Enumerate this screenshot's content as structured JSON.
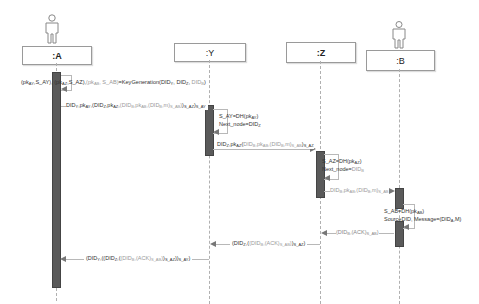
{
  "participants": [
    {
      "id": "A",
      "label": ":A",
      "actor": true
    },
    {
      "id": "Y",
      "label": ":Y",
      "actor": false
    },
    {
      "id": "Z",
      "label": ":Z",
      "actor": false
    },
    {
      "id": "B",
      "label": ":B",
      "actor": true
    }
  ],
  "messages": [
    {
      "from": "A",
      "to": "A",
      "type": "self",
      "label": "(pk_AY, S_AY), (pk_AZ, S_AZ), (pk_AB, S_AB)=KeyGeneration(DID_Y, DID_Z, DID_B)"
    },
    {
      "from": "A",
      "to": "Y",
      "type": "sync",
      "label": "DID_Y, pk_AY, (DID_Z, pk_AZ, (DID_B, pk_AB, (DID_B, m)_S_AB)_S_AZ)_S_AY"
    },
    {
      "from": "Y",
      "to": "Y",
      "type": "self",
      "label": "S_AY=DH(pk_AY); Next_node=DID_Z"
    },
    {
      "from": "Y",
      "to": "Z",
      "type": "sync",
      "label": "DID_Z, pk_AZ, (DID_B, pk_AB, (DID_B, m)_S_AB)_S_AZ"
    },
    {
      "from": "Z",
      "to": "Z",
      "type": "self",
      "label": "S_AZ=DH(pk_AZ); Next_node=DID_B"
    },
    {
      "from": "Z",
      "to": "B",
      "type": "sync",
      "label": "DID_B, pk_AB, (DID_B, m)_S_AB"
    },
    {
      "from": "B",
      "to": "B",
      "type": "self",
      "label": "S_AB=DH(pk_AB); SourceDID, Message=(DID_A, M)"
    },
    {
      "from": "B",
      "to": "Z",
      "type": "return",
      "label": "(DID_B, (ACK)_S_AB)"
    },
    {
      "from": "Z",
      "to": "Y",
      "type": "return",
      "label": "(DID_Z, ((DID_B, (ACK)_S_AB))_S_AZ)"
    },
    {
      "from": "Y",
      "to": "A",
      "type": "return",
      "label": "(DID_Y, ((DID_Z, ((DID_B, (ACK)_S_AB))_S_AZ))_S_AY)"
    }
  ],
  "text": {
    "p_A": ":A",
    "p_Y": ":Y",
    "p_Z": ":Z",
    "p_B": ":B",
    "selfA_pre": "(pk",
    "selfA_fn": "=KeyGeneration(DID",
    "selfY_1": "S_AY=DH(pk",
    "selfY_2": "Next_node=DID",
    "selfZ_1": "S_AZ=DH(pk",
    "selfZ_2": "Next_node=DID",
    "selfB_1": "S_AB=DH(pk",
    "selfB_2": "SourceDID, Message=(DID",
    "selfB_2_end": ",M)"
  },
  "colors": {
    "activation": "#5a5a5a",
    "lifeline": "#b0b0b0",
    "box_border": "#9a9a9a",
    "message_line": "#b8b8b8"
  }
}
